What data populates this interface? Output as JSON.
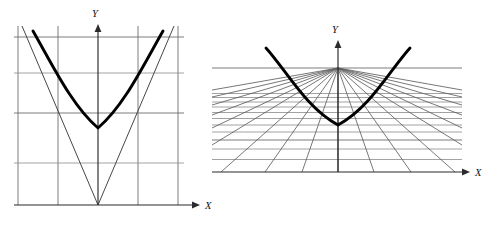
{
  "figure": {
    "background_color": "#ffffff",
    "curve_color": "#000000",
    "grid_color": "#6e6e6e",
    "axis_color": "#2b2b2b",
    "width": 497,
    "height": 225
  },
  "panels": [
    {
      "id": "left-panel",
      "name": "affine-coordinate-panel",
      "projection": "cartesian",
      "axes": {
        "x": {
          "label": "X",
          "origin_px": 98,
          "line_y_px": 205,
          "start_x_px": 14,
          "end_x_px": 196,
          "arrow": "right"
        },
        "y": {
          "label": "Y",
          "line_x_px": 98,
          "start_y_px": 205,
          "end_y_px": 24,
          "arrow": "up"
        }
      },
      "grid": {
        "vertical_x_px": [
          18,
          58,
          98,
          138,
          178
        ],
        "horizontal_y_px": [
          37,
          73,
          113,
          163,
          205
        ],
        "style": "uniform-rectangular"
      },
      "asymptotes": {
        "description": "two straight lines meeting at the origin forming a V",
        "apex_px": [
          98,
          205
        ],
        "left_end_px": [
          22,
          26
        ],
        "right_end_px": [
          174,
          26
        ]
      },
      "curve": {
        "type": "hyperbola-branch",
        "description": "thick branch opening upward, vertex on a gridline",
        "vertex_px": [
          98,
          128
        ],
        "left_end_px": [
          33,
          31
        ],
        "right_end_px": [
          163,
          31
        ]
      }
    },
    {
      "id": "right-panel",
      "name": "projective-coordinate-panel",
      "projection": "perspective",
      "axes": {
        "x": {
          "label": "X",
          "origin_px": 338,
          "line_y_px": 172,
          "start_x_px": 212,
          "end_x_px": 470,
          "arrow": "right"
        },
        "y": {
          "label": "Y",
          "line_x_px": 338,
          "start_y_px": 172,
          "end_y_px": 40,
          "arrow": "up"
        }
      },
      "grid": {
        "vanishing_point_px": [
          338,
          68
        ],
        "horizon_y_px": 68,
        "ray_count": 17,
        "horizontal_line_count": 13,
        "left_edge_px": 212,
        "right_edge_px": 462,
        "style": "one-point-perspective"
      },
      "curve": {
        "type": "hyperbola-branch",
        "description": "thick branch opening upward, tangent to horizon at vanishing point",
        "vertex_px": [
          338,
          125
        ],
        "left_end_px": [
          266,
          48
        ],
        "right_end_px": [
          410,
          48
        ]
      }
    }
  ]
}
